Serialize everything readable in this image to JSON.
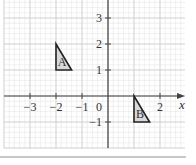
{
  "figure": {
    "title": "",
    "axes": {
      "x_label": "x",
      "x_ticks": [
        {
          "value": -3,
          "label": "−3"
        },
        {
          "value": -2,
          "label": "−2"
        },
        {
          "value": -1,
          "label": "−1"
        },
        {
          "value": 2,
          "label": "2"
        }
      ],
      "y_ticks": [
        {
          "value": 3,
          "label": "3"
        },
        {
          "value": 2,
          "label": "2"
        },
        {
          "value": 1,
          "label": "1"
        },
        {
          "value": -1,
          "label": "−1"
        }
      ],
      "origin_label": "0",
      "x_range": [
        -4,
        3
      ],
      "y_range": [
        -2,
        3.7
      ],
      "minor_divisions_per_unit": 5
    },
    "shapes": [
      {
        "label": "A",
        "vertices": [
          [
            -2,
            2
          ],
          [
            -2,
            1
          ],
          [
            -1.4,
            1
          ]
        ],
        "fill": "#d9d9d9"
      },
      {
        "label": "B",
        "vertices": [
          [
            1,
            0
          ],
          [
            1,
            -1
          ],
          [
            1.6,
            -1
          ]
        ],
        "fill": "#d9d9d9"
      }
    ],
    "colors": {
      "axis": "#444444",
      "major_grid": "#cfcfcf",
      "minor_grid": "#e6e6e6",
      "shape_stroke": "#222222"
    }
  }
}
